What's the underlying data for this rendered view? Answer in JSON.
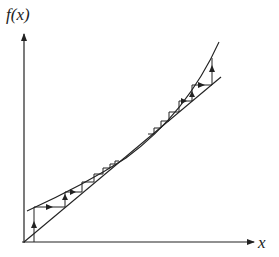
{
  "diagram": {
    "y_axis_label": "f(x)",
    "x_axis_label": "x",
    "colors": {
      "stroke": "#222222",
      "background": "#ffffff"
    },
    "elements": [
      "vertical f(x) axis with arrow",
      "horizontal x axis with arrow",
      "diagonal line y = x",
      "convex curve f(x) tangent to diagonal near the middle",
      "cobweb staircase from lower-left converging to tangent point",
      "cobweb staircase from upper-right diverging/moving away"
    ]
  }
}
